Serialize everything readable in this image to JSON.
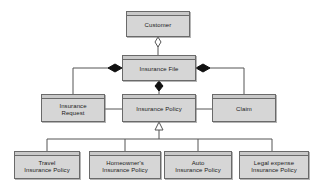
{
  "diagram": {
    "type": "uml-class-diagram",
    "background_color": "#ffffff",
    "box_fill_color": "#d6d6d6",
    "box_header_color": "#c9c9c9",
    "box_border_color": "#6a6a6a",
    "line_color": "#555555",
    "text_color": "#1a1a1a"
  },
  "nodes": [
    {
      "id": "customer",
      "label": "Customer",
      "x": 126,
      "y": 11,
      "w": 64,
      "h": 26
    },
    {
      "id": "insfile",
      "label": "Insurance File",
      "x": 122,
      "y": 55,
      "w": 74,
      "h": 26
    },
    {
      "id": "insrequest",
      "label": "Insurance\nRequest",
      "x": 41,
      "y": 94,
      "w": 64,
      "h": 28
    },
    {
      "id": "inspolicy",
      "label": "Insurance Policy",
      "x": 122,
      "y": 94,
      "w": 74,
      "h": 28
    },
    {
      "id": "claim",
      "label": "Claim",
      "x": 212,
      "y": 94,
      "w": 64,
      "h": 28
    },
    {
      "id": "travel",
      "label": "Travel\nInsurance Policy",
      "x": 14,
      "y": 151,
      "w": 66,
      "h": 28
    },
    {
      "id": "homeowner",
      "label": "Homeowner's\nInsurance Policy",
      "x": 89,
      "y": 151,
      "w": 72,
      "h": 28
    },
    {
      "id": "auto",
      "label": "Auto\nInsurance Policy",
      "x": 164,
      "y": 151,
      "w": 68,
      "h": 28
    },
    {
      "id": "legal",
      "label": "Legal expense\nInsurance Policy",
      "x": 239,
      "y": 151,
      "w": 70,
      "h": 28
    }
  ],
  "relations": [
    {
      "id": "customer-insfile",
      "type": "aggregation",
      "marker": "hollow-diamond",
      "from": "customer",
      "to": "insfile"
    },
    {
      "id": "insfile-insrequest",
      "type": "composition",
      "marker": "filled-diamond",
      "from": "insfile",
      "to": "insrequest"
    },
    {
      "id": "insfile-inspolicy",
      "type": "composition",
      "marker": "filled-diamond",
      "from": "insfile",
      "to": "inspolicy"
    },
    {
      "id": "insfile-claim",
      "type": "composition",
      "marker": "filled-diamond",
      "from": "insfile",
      "to": "claim"
    },
    {
      "id": "insrequest-inspolicy",
      "type": "association",
      "marker": "none",
      "from": "insrequest",
      "to": "inspolicy"
    },
    {
      "id": "inspolicy-claim",
      "type": "association",
      "marker": "none",
      "from": "inspolicy",
      "to": "claim"
    },
    {
      "id": "inspolicy-travel",
      "type": "generalization",
      "marker": "hollow-triangle",
      "from": "travel",
      "to": "inspolicy"
    },
    {
      "id": "inspolicy-homeowner",
      "type": "generalization",
      "marker": "hollow-triangle",
      "from": "homeowner",
      "to": "inspolicy"
    },
    {
      "id": "inspolicy-auto",
      "type": "generalization",
      "marker": "hollow-triangle",
      "from": "auto",
      "to": "inspolicy"
    },
    {
      "id": "inspolicy-legal",
      "type": "generalization",
      "marker": "hollow-triangle",
      "from": "legal",
      "to": "inspolicy"
    }
  ]
}
